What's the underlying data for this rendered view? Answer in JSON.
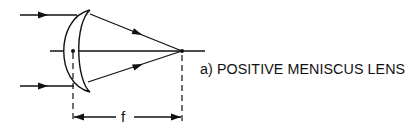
{
  "diagram": {
    "caption": "a) POSITIVE MENISCUS LENS",
    "focal_length_label": "f",
    "elements": {
      "lens": "positive-meniscus-lens",
      "incoming_rays": 2,
      "optical_axis": true,
      "principal_point": true,
      "focal_point": true,
      "dimension": "f"
    },
    "colors": {
      "line": "#111111",
      "background": "#ffffff"
    }
  }
}
